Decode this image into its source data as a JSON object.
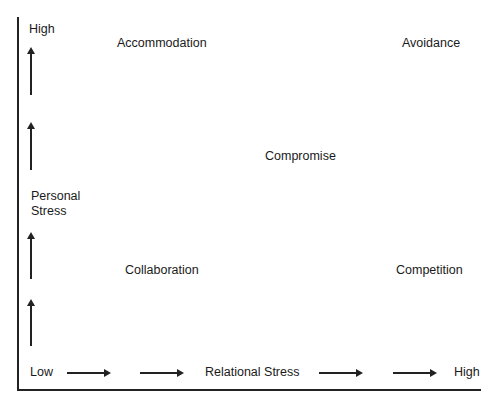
{
  "y_axis": {
    "high_label": "High",
    "title_line1": "Personal",
    "title_line2": "Stress"
  },
  "x_axis": {
    "low_label": "Low",
    "title": "Relational Stress",
    "high_label": "High"
  },
  "quadrants": {
    "top_left": "Accommodation",
    "top_right": "Avoidance",
    "center": "Compromise",
    "bottom_left": "Collaboration",
    "bottom_right": "Competition"
  }
}
